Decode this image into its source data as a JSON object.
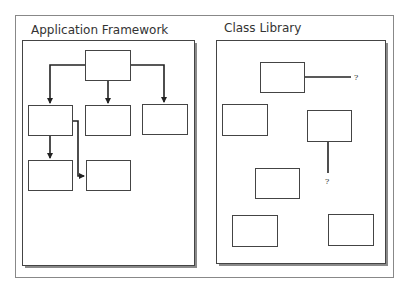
{
  "diagram": {
    "panels": [
      {
        "id": "framework",
        "title": "Application Framework",
        "rect": {
          "x": 22,
          "y": 40,
          "w": 173,
          "h": 226
        },
        "boxes": [
          {
            "id": "root",
            "x": 85,
            "y": 50,
            "w": 46,
            "h": 31
          },
          {
            "id": "child-1",
            "x": 28,
            "y": 105,
            "w": 45,
            "h": 31
          },
          {
            "id": "child-2",
            "x": 85,
            "y": 105,
            "w": 46,
            "h": 31
          },
          {
            "id": "child-3",
            "x": 142,
            "y": 104,
            "w": 46,
            "h": 31
          },
          {
            "id": "grandchild-1",
            "x": 28,
            "y": 160,
            "w": 45,
            "h": 31
          },
          {
            "id": "grandchild-2",
            "x": 86,
            "y": 160,
            "w": 45,
            "h": 31
          }
        ]
      },
      {
        "id": "library",
        "title": "Class Library",
        "rect": {
          "x": 216,
          "y": 40,
          "w": 170,
          "h": 224
        },
        "boxes": [
          {
            "id": "class-a",
            "x": 260,
            "y": 62,
            "w": 44,
            "h": 30
          },
          {
            "id": "class-b",
            "x": 222,
            "y": 104,
            "w": 45,
            "h": 31
          },
          {
            "id": "class-c",
            "x": 307,
            "y": 110,
            "w": 44,
            "h": 31
          },
          {
            "id": "class-d",
            "x": 255,
            "y": 168,
            "w": 44,
            "h": 30
          },
          {
            "id": "class-e",
            "x": 232,
            "y": 215,
            "w": 45,
            "h": 31
          },
          {
            "id": "class-f",
            "x": 328,
            "y": 214,
            "w": 45,
            "h": 31
          }
        ],
        "unknown_labels": [
          {
            "text": "?",
            "x": 355,
            "y": 80
          },
          {
            "text": "?",
            "x": 326,
            "y": 184
          }
        ]
      }
    ],
    "outer_frame": {
      "x": 15,
      "y": 15,
      "w": 379,
      "h": 263
    },
    "colors": {
      "stroke": "#444444",
      "shadow": "#888888",
      "frame": "#888888",
      "background": "#ffffff"
    }
  }
}
